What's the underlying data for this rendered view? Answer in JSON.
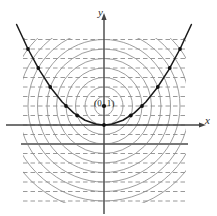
{
  "figure": {
    "title": "",
    "axis_labels": {
      "x": "x",
      "y": "y"
    },
    "annotations": [
      {
        "name": "focus-label",
        "text": "(0, 1)",
        "x": 0,
        "y": 1
      }
    ],
    "colors": {
      "axis": "#444444",
      "curve": "#1a1a1a",
      "circle": "#8d8d8d",
      "dashed": "#8d8d8d",
      "directrix": "#777777",
      "point": "#111111",
      "background": "#ffffff"
    }
  },
  "chart_data": {
    "type": "line",
    "title": "",
    "xlabel": "x",
    "ylabel": "y",
    "grid": true,
    "legend": null,
    "xlim": [
      -5.2,
      5.2
    ],
    "ylim": [
      -5.0,
      5.4
    ],
    "curves": [
      {
        "name": "parabola",
        "equation": "y = x^2 / 4",
        "focus": [
          0,
          1
        ],
        "directrix_y": -1,
        "vertex": [
          0,
          0
        ],
        "x": [
          -4.6,
          -4.0,
          -3.4,
          -2.8,
          -2.2,
          -1.6,
          -1.0,
          -0.4,
          0.0,
          0.4,
          1.0,
          1.6,
          2.2,
          2.8,
          3.4,
          4.0,
          4.6
        ],
        "y": [
          5.29,
          4.0,
          2.89,
          1.96,
          1.21,
          0.64,
          0.25,
          0.04,
          0.0,
          0.04,
          0.25,
          0.64,
          1.21,
          1.96,
          2.89,
          4.0,
          5.29
        ]
      }
    ],
    "marked_points": {
      "name": "construction-points",
      "x": [
        -4.0,
        -3.46,
        -2.83,
        -2.0,
        -1.41,
        0.0,
        1.41,
        2.0,
        2.83,
        3.46,
        4.0
      ],
      "y": [
        4.0,
        3.0,
        2.0,
        1.0,
        0.5,
        0.0,
        0.5,
        1.0,
        2.0,
        3.0,
        4.0
      ]
    },
    "focus_point": {
      "x": 0,
      "y": 1
    },
    "concentric_circles": {
      "center": [
        0,
        1
      ],
      "radii": [
        0.5,
        1.0,
        1.5,
        2.0,
        2.5,
        3.0,
        3.5,
        4.0,
        4.5,
        5.0,
        5.5
      ]
    },
    "horizontal_dashed_lines_y": [
      -4.5,
      -4.0,
      -3.5,
      -3.0,
      -2.5,
      -2.0,
      -1.5,
      -0.5,
      0.0,
      0.5,
      1.0,
      1.5,
      2.0,
      2.5,
      3.0,
      3.5,
      4.0,
      4.5
    ],
    "solid_horizontal_line_y": -1,
    "axes": {
      "x_axis_y": 0,
      "y_axis_x": 0
    }
  }
}
